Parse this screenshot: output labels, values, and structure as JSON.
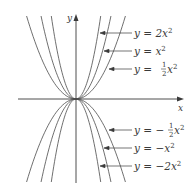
{
  "figure": {
    "axes": {
      "x_label": "x",
      "y_label": "y",
      "origin_px": [
        76,
        99
      ]
    },
    "curves": [
      {
        "id": "2x2",
        "coef": 2,
        "label_prefix": "y = ",
        "label_coef": "2",
        "label_var": "x",
        "label_exp": "2",
        "frac": false,
        "neg": false
      },
      {
        "id": "x2",
        "coef": 1,
        "label_prefix": "y = ",
        "label_coef": "",
        "label_var": "x",
        "label_exp": "2",
        "frac": false,
        "neg": false
      },
      {
        "id": "half-x2",
        "coef": 0.5,
        "label_prefix": "y = ",
        "label_coef": "",
        "label_var": "x",
        "label_exp": "2",
        "frac": true,
        "frac_num": "1",
        "frac_den": "2",
        "neg": false
      },
      {
        "id": "neg-half-x2",
        "coef": -0.5,
        "label_prefix": "y = −",
        "label_coef": "",
        "label_var": "x",
        "label_exp": "2",
        "frac": true,
        "frac_num": "1",
        "frac_den": "2",
        "neg": true
      },
      {
        "id": "neg-x2",
        "coef": -1,
        "label_prefix": "y = −",
        "label_coef": "",
        "label_var": "x",
        "label_exp": "2",
        "frac": false,
        "neg": true
      },
      {
        "id": "neg-2x2",
        "coef": -2,
        "label_prefix": "y = −",
        "label_coef": "2",
        "label_var": "x",
        "label_exp": "2",
        "frac": false,
        "neg": true
      }
    ],
    "labels": {
      "l1": "y = 2x",
      "l2": "y = x",
      "l3_pre": "y = ",
      "l3_post": "x",
      "l4_pre": "y = −",
      "l4_post": "x",
      "l5": "y = −x",
      "l6": "y = −2x",
      "exp": "2",
      "half_num": "1",
      "half_den": "2"
    },
    "colors": {
      "curve": "#4a4a4a",
      "axis": "#3a3a3a",
      "text": "#3a3a3a"
    }
  }
}
